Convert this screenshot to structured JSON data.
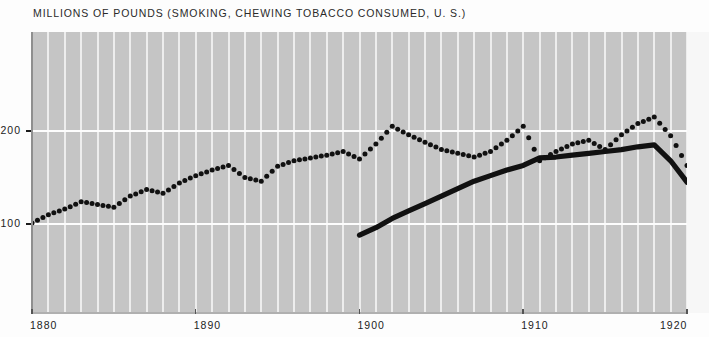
{
  "chart_data": {
    "type": "line",
    "title": "MILLIONS OF POUNDS (SMOKING, CHEWING TOBACCO CONSUMED, U. S.)",
    "xlabel": "",
    "ylabel": "",
    "xlim": [
      1880,
      1920
    ],
    "ylim": [
      0,
      240
    ],
    "yticks": [
      100,
      200
    ],
    "ytick_labels": [
      "100",
      "200"
    ],
    "xticks": [
      1880,
      1890,
      1900,
      1910,
      1920
    ],
    "xtick_labels": [
      "1880",
      "1890",
      "1900",
      "1910",
      "1920"
    ],
    "grid": "vertical yearly white gridlines, horizontal lines at 100 and 200",
    "legend": "none",
    "series": [
      {
        "name": "smoking-tobacco-dotted",
        "style": "dotted",
        "color": "#111111",
        "x": [
          1880,
          1881,
          1882,
          1883,
          1884,
          1885,
          1886,
          1887,
          1888,
          1889,
          1890,
          1891,
          1892,
          1893,
          1894,
          1895,
          1896,
          1897,
          1898,
          1899,
          1900,
          1901,
          1902,
          1903,
          1904,
          1905,
          1906,
          1907,
          1908,
          1909,
          1910,
          1911,
          1912,
          1913,
          1914,
          1915,
          1916,
          1917,
          1918,
          1919,
          1920
        ],
        "values": [
          101,
          110,
          116,
          124,
          121,
          118,
          130,
          137,
          133,
          144,
          152,
          158,
          163,
          150,
          146,
          162,
          168,
          171,
          174,
          178,
          170,
          186,
          205,
          196,
          188,
          180,
          176,
          172,
          178,
          190,
          205,
          168,
          178,
          186,
          190,
          180,
          196,
          208,
          215,
          195,
          163
        ]
      },
      {
        "name": "chewing-tobacco-solid",
        "style": "solid",
        "color": "#111111",
        "x": [
          1900,
          1901,
          1902,
          1903,
          1904,
          1905,
          1906,
          1907,
          1908,
          1909,
          1910,
          1911,
          1912,
          1913,
          1914,
          1915,
          1916,
          1917,
          1918,
          1919,
          1920
        ],
        "values": [
          88,
          96,
          106,
          114,
          122,
          130,
          138,
          146,
          152,
          158,
          163,
          171,
          172,
          174,
          176,
          178,
          180,
          183,
          185,
          168,
          145
        ]
      }
    ]
  }
}
